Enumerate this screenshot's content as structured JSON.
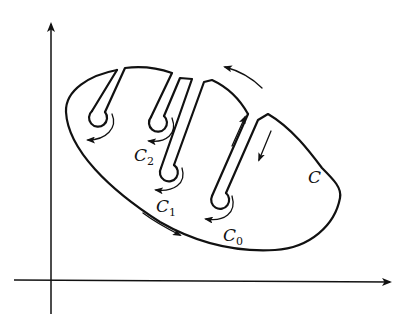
{
  "figure": {
    "colors": {
      "ink": "#111111",
      "background": "#ffffff"
    }
  },
  "axes": {
    "x_axis": {
      "label": "",
      "arrow": "right"
    },
    "y_axis": {
      "label": "",
      "arrow": "up"
    }
  },
  "labels": {
    "outer_contour": {
      "main": "C",
      "sub": ""
    },
    "circle_0": {
      "main": "C",
      "sub": "0"
    },
    "circle_1": {
      "main": "C",
      "sub": "1"
    },
    "circle_2": {
      "main": "C",
      "sub": "2"
    }
  },
  "direction_arrows": [
    {
      "location": "bottom-left of outer contour",
      "direction": "down-right"
    },
    {
      "location": "top of outer contour",
      "direction": "up-left"
    },
    {
      "location": "left side of right slit",
      "direction": "up"
    },
    {
      "location": "right side of right slit",
      "direction": "down"
    },
    {
      "location": "around C0",
      "direction": "clockwise"
    },
    {
      "location": "around C1",
      "direction": "clockwise"
    },
    {
      "location": "around C2",
      "direction": "clockwise"
    },
    {
      "location": "around leftmost circle",
      "direction": "clockwise"
    }
  ]
}
